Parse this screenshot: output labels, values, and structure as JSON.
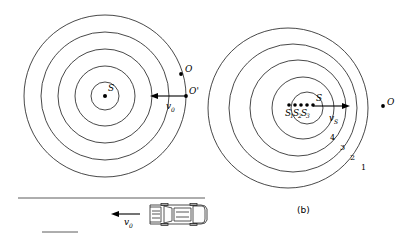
{
  "figure": {
    "panel_label_b": "(b)",
    "stroke_color": "#1a1a1a",
    "background_color": "#ffffff"
  },
  "panel_a": {
    "name": "stationary-source-moving-observer",
    "center_label": "S",
    "observer_label": "O",
    "observer_prime_label": "O'",
    "velocity_label": "v",
    "velocity_subscript": "0",
    "circle_radii": [
      14,
      30,
      47,
      64,
      81
    ],
    "center": {
      "x": 105,
      "y": 96
    },
    "circle_count": 5
  },
  "panel_b": {
    "name": "moving-source-stationary-observer",
    "source_label": "S",
    "source_history_labels": [
      "S",
      "S",
      "S"
    ],
    "source_history_subscripts": [
      "1",
      "2",
      "3"
    ],
    "observer_label": "O",
    "velocity_label": "v",
    "velocity_subscript": "S",
    "wavefront_numbers": [
      "1",
      "2",
      "3",
      "4"
    ],
    "center": {
      "x": 300,
      "y": 108
    },
    "circle_count": 5
  },
  "car_inset": {
    "name": "car-top-view",
    "velocity_label": "v",
    "velocity_subscript": "0",
    "road_label": ""
  }
}
